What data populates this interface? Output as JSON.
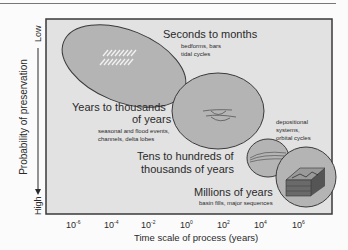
{
  "diagram": {
    "y_axis": {
      "label": "Probability of preservation",
      "top": "Low",
      "bottom": "High"
    },
    "x_axis": {
      "label": "Time scale of process (years)",
      "ticks": [
        {
          "base": "10",
          "exp": "-6"
        },
        {
          "base": "10",
          "exp": "-4"
        },
        {
          "base": "10",
          "exp": "-2"
        },
        {
          "base": "10",
          "exp": "0"
        },
        {
          "base": "10",
          "exp": "2"
        },
        {
          "base": "10",
          "exp": "4"
        },
        {
          "base": "10",
          "exp": "6"
        }
      ]
    },
    "scales": [
      {
        "title": "Seconds to months",
        "examples": [
          "bedforms, bars",
          "tidal cycles"
        ]
      },
      {
        "title": [
          "Years to thousands",
          "of years"
        ],
        "examples": [
          "seasonal and flood events,",
          "channels, delta lobes"
        ]
      },
      {
        "title": "",
        "examples": [
          "depositional",
          "systems,",
          "orbital cycles"
        ]
      },
      {
        "title": [
          "Tens to hundreds of",
          "thousands of years"
        ],
        "examples": []
      },
      {
        "title": "Millions of years",
        "examples": [
          "basin fills, major sequences"
        ]
      }
    ],
    "colors": {
      "plot_bg": "#e2e2e2",
      "ellipse_fill": "#b4b4b4",
      "ellipse_stroke": "#3a3a3a",
      "frame": "#3a3a3a"
    }
  }
}
